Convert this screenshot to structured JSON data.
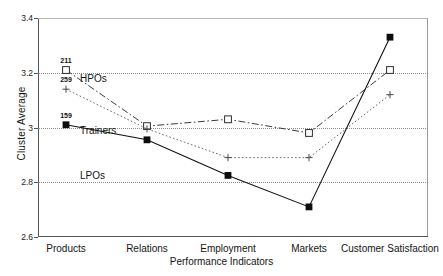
{
  "chart_data": {
    "type": "line",
    "title": "",
    "xlabel": "Performance Indicators",
    "ylabel": "Cluster Average",
    "categories": [
      "Products",
      "Relations",
      "Employment",
      "Markets",
      "Customer Satisfaction"
    ],
    "ylim": [
      2.6,
      3.4
    ],
    "yticks": [
      "2.6",
      "2.8",
      "3",
      "3.2",
      "3.4"
    ],
    "ytick_values": [
      2.6,
      2.8,
      3.0,
      3.2,
      3.4
    ],
    "grid": true,
    "legend_position": "inline-annotations",
    "series": [
      {
        "name": "HPOs",
        "marker": "open-square",
        "line_style": "dash-dot",
        "values": [
          3.21,
          3.005,
          3.03,
          2.98,
          3.21
        ],
        "n_label": "211"
      },
      {
        "name": "Trainers",
        "marker": "plus",
        "line_style": "dotted",
        "values": [
          3.14,
          2.995,
          2.89,
          2.89,
          3.12
        ],
        "n_label": "259"
      },
      {
        "name": "LPOs",
        "marker": "filled-square",
        "line_style": "solid",
        "values": [
          3.01,
          2.955,
          2.825,
          2.71,
          3.33
        ],
        "n_label": "159"
      }
    ],
    "annotations": [
      {
        "text": "HPOs",
        "x_px": 42,
        "y_px": 55
      },
      {
        "text": "Trainers",
        "x_px": 42,
        "y_px": 107
      },
      {
        "text": "LPOs",
        "x_px": 42,
        "y_px": 152
      }
    ]
  },
  "colors": {
    "axis": "#555555",
    "grid": "#8e8e8e",
    "series_hpos": "#3a3a3a",
    "series_trainers": "#6a6a6a",
    "series_lpos": "#111111",
    "background": "#ffffff"
  }
}
